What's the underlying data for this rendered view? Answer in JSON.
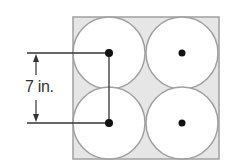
{
  "diagram": {
    "dimension_label": "7 in.",
    "colors": {
      "box_fill": "#e6e6e6",
      "box_stroke": "#a0a0a0",
      "circle_fill": "#ffffff",
      "circle_stroke": "#a0a0a0",
      "line": "#333333",
      "dot": "#111111"
    },
    "circles": [
      {
        "cx": 109,
        "cy": 53
      },
      {
        "cx": 182,
        "cy": 53
      },
      {
        "cx": 109,
        "cy": 123
      },
      {
        "cx": 182,
        "cy": 123
      }
    ]
  }
}
